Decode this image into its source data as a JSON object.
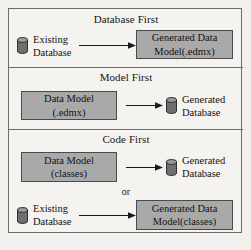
{
  "figure": {
    "background_color": "#f3f1ed",
    "frame_color": "#6e6e6e",
    "box_fill_color": "#a9a9a9",
    "box_border_color": "#4a4a4a",
    "text_color": "#121212",
    "arrow_color": "#1a1a1a",
    "cylinder_color": "#6b6b6b"
  },
  "sections": [
    {
      "id": "database-first",
      "title": "Database First",
      "source": {
        "kind": "database-cylinder",
        "icon": "database-cylinder-icon",
        "lines": [
          "Existing",
          "Database"
        ]
      },
      "target": {
        "kind": "model-box",
        "lines": [
          "Generated Data",
          "Model(.edmx)"
        ]
      },
      "arrow": "arrow-right-icon"
    },
    {
      "id": "model-first",
      "title": "Model First",
      "source": {
        "kind": "model-box",
        "lines": [
          "Data Model",
          "(.edmx)"
        ]
      },
      "target": {
        "kind": "database-cylinder",
        "icon": "database-cylinder-icon",
        "lines": [
          "Generated",
          "Database"
        ]
      },
      "arrow": "arrow-right-icon"
    },
    {
      "id": "code-first",
      "title": "Code First",
      "connector": "or",
      "flow_a": {
        "source": {
          "kind": "model-box",
          "lines": [
            "Data Model",
            "(classes)"
          ]
        },
        "target": {
          "kind": "database-cylinder",
          "icon": "database-cylinder-icon",
          "lines": [
            "Generated",
            "Database"
          ]
        },
        "arrow": "arrow-right-icon"
      },
      "flow_b": {
        "source": {
          "kind": "database-cylinder",
          "icon": "database-cylinder-icon",
          "lines": [
            "Existing",
            "Database"
          ]
        },
        "target": {
          "kind": "model-box",
          "lines": [
            "Generated Data",
            "Model(classes)"
          ]
        },
        "arrow": "arrow-right-icon"
      }
    }
  ]
}
